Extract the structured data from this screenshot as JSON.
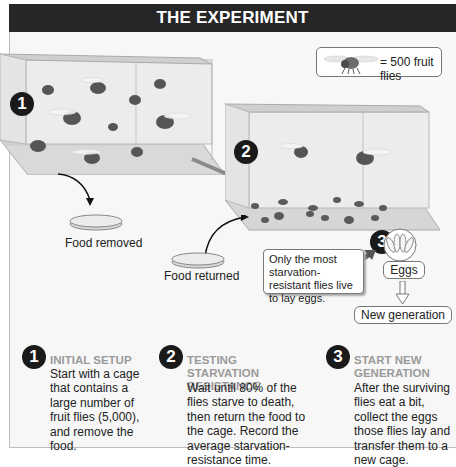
{
  "title": "THE EXPERIMENT",
  "legend": {
    "icon": "fruit-fly-icon",
    "text": "= 500 fruit flies"
  },
  "diagram": {
    "cage1": {
      "badge": "1",
      "fly_count": 11
    },
    "cage2": {
      "badge": "2",
      "living_flies": 2,
      "dead_flies": 12
    },
    "step3_badge": "3",
    "food_removed_label": "Food removed",
    "food_returned_label": "Food returned",
    "callout_text": "Only the most starvation-resistant flies live to lay eggs.",
    "eggs_label": "Eggs",
    "new_generation_label": "New generation"
  },
  "steps": [
    {
      "number": "1",
      "heading": "INITIAL SETUP",
      "text_lines": [
        "Start with a cage",
        "that contains a",
        "large number of",
        "fruit flies (5,000),",
        "and remove the",
        "food."
      ]
    },
    {
      "number": "2",
      "heading_lines": [
        "TESTING STARVATION",
        "RESISTANCE"
      ],
      "text_lines": [
        "Wait until 80% of the",
        "flies starve to death,",
        "then return the food to",
        "the cage. Record the",
        "average starvation-",
        "resistance time."
      ]
    },
    {
      "number": "3",
      "heading_lines": [
        "START NEW",
        "GENERATION"
      ],
      "text_lines": [
        "After the surviving",
        "flies eat a bit,",
        "collect the eggs",
        "those flies lay and",
        "transfer them to a",
        "new cage."
      ]
    }
  ],
  "colors": {
    "title_bg": "#262626",
    "heading_gray": "#9a9a9a",
    "badge": "#1a1a1a",
    "frame_bg": "#f7f7f7"
  }
}
